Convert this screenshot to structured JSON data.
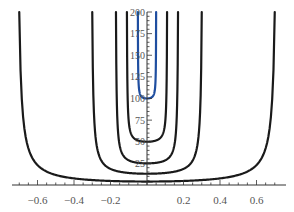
{
  "chart_data": {
    "type": "line",
    "title": "",
    "xlabel": "",
    "ylabel": "",
    "xlim": [
      -0.75,
      0.75
    ],
    "ylim": [
      0,
      200
    ],
    "grid": false,
    "legend": null,
    "x_ticks": [
      -0.6,
      -0.4,
      -0.2,
      0.2,
      0.4,
      0.6
    ],
    "x_tick_labels": [
      "−0.6",
      "−0.4",
      "−0.2",
      "0.2",
      "0.4",
      "0.6"
    ],
    "y_ticks": [
      25,
      50,
      75,
      100,
      125,
      150,
      175,
      200
    ],
    "y_tick_labels": [
      "25",
      "50",
      "75",
      "100",
      "125",
      "150",
      "175",
      "200"
    ],
    "series": [
      {
        "name": "curve-1",
        "color": "#1a1a1a",
        "minimum": 4,
        "half_width_at_top": 0.7
      },
      {
        "name": "curve-2",
        "color": "#1a1a1a",
        "minimum": 13,
        "half_width_at_top": 0.3
      },
      {
        "name": "curve-3",
        "color": "#1a1a1a",
        "minimum": 25,
        "half_width_at_top": 0.17
      },
      {
        "name": "curve-4",
        "color": "#1a1a1a",
        "minimum": 50,
        "half_width_at_top": 0.11
      },
      {
        "name": "curve-5",
        "color": "#1f4ea0",
        "minimum": 100,
        "half_width_at_top": 0.05
      }
    ]
  },
  "axes": {
    "x_tick_labels": [
      "−0.6",
      "−0.4",
      "−0.2",
      "0.2",
      "0.4",
      "0.6"
    ],
    "y_tick_labels": [
      "25",
      "50",
      "75",
      "100",
      "125",
      "150",
      "175",
      "200"
    ]
  },
  "colors": {
    "black_curve": "#1a1a1a",
    "blue_curve": "#1f4ea0",
    "axis": "#333333"
  }
}
